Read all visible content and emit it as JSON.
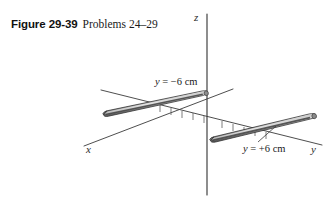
{
  "figure": {
    "number_label": "Figure 29-39",
    "problems_label": "Problems 24–29"
  },
  "axes": {
    "z_label": "z",
    "x_label": "x",
    "y_label": "y",
    "axis_color": "#3a3a3a",
    "tick_count_negative_side": 5,
    "tick_count_positive_side": 5
  },
  "annotations": {
    "upper_rod": {
      "variable": "y",
      "equals": " = ",
      "value": "−6 cm",
      "full_text": "y = −6 cm"
    },
    "lower_rod": {
      "variable": "y",
      "equals": " = ",
      "value": "+6 cm",
      "full_text": "y = +6 cm"
    }
  },
  "rods": {
    "count": 2,
    "body_color": "#9a9a9a",
    "highlight_color": "#e2e2e2",
    "shadow_color": "#4a4a4a",
    "outline_color": "#2e2e2e",
    "upper_rod_position": "y = −6 cm",
    "lower_rod_position": "y = +6 cm"
  },
  "background_color": "#ffffff"
}
